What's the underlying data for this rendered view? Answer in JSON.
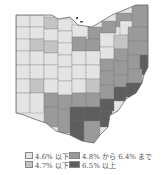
{
  "map": {
    "region": "Ohio",
    "colors": {
      "lowest": "#e4e4e4",
      "low": "#c4c4c4",
      "mid": "#9a9a9a",
      "high": "#5e5e5e",
      "border": "#777777"
    }
  },
  "legend": {
    "items": [
      {
        "label": "4.6% 以下",
        "color": "#e4e4e4"
      },
      {
        "label": "4.8% から 6.4% まで",
        "color": "#9a9a9a"
      },
      {
        "label": "4.7% 以下",
        "color": "#c4c4c4"
      },
      {
        "label": "6.5% 以上",
        "color": "#5e5e5e"
      }
    ]
  }
}
